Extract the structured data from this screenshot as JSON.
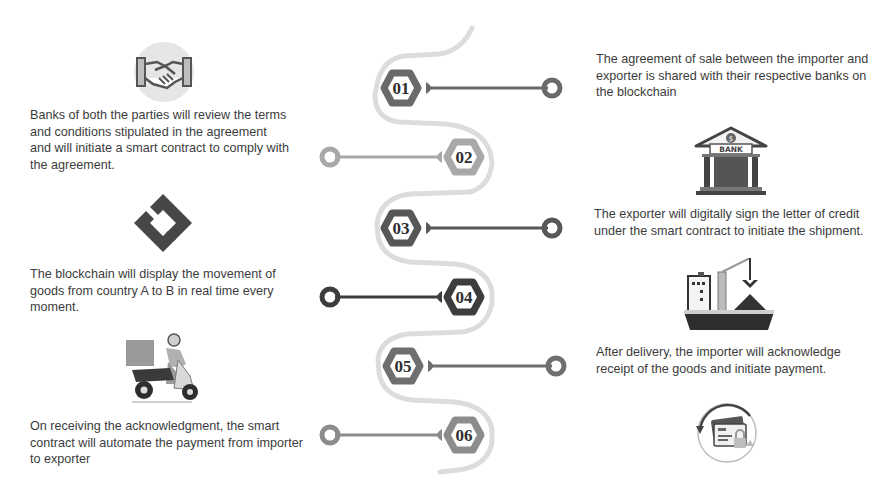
{
  "steps": [
    {
      "number": "01",
      "side": "right",
      "text": "The agreement of sale between the importer and exporter is shared with their respective banks on the blockchain",
      "tone": "#6a6a6a"
    },
    {
      "number": "02",
      "side": "left",
      "text": "Banks of both the parties will review the terms and conditions stipulated in the agreement and will initiate a smart contract to comply with the agreement.",
      "tone": "#a8a8a8"
    },
    {
      "number": "03",
      "side": "right",
      "text": "The exporter will digitally sign the letter of credit under the smart contract to initiate the shipment.",
      "tone": "#575757"
    },
    {
      "number": "04",
      "side": "left",
      "text": "The blockchain will display the movement of goods from country A to B in real time every moment.",
      "tone": "#3d3d3d"
    },
    {
      "number": "05",
      "side": "right",
      "text": "After delivery, the importer will acknowledge receipt of the goods and initiate payment.",
      "tone": "#6f6f6f"
    },
    {
      "number": "06",
      "side": "left",
      "text": "On receiving the acknowledgment, the smart contract will automate the payment from importer to exporter",
      "tone": "#8c8c8c"
    }
  ],
  "icons": {
    "handshake": "handshake-icon",
    "bank": "bank-icon",
    "bank_label": "BANK",
    "bank_symbol": "$",
    "blockchain": "blockchain-logo-icon",
    "ship": "cargo-ship-icon",
    "scooter": "delivery-scooter-icon",
    "payment": "secure-card-payment-icon"
  },
  "colors": {
    "wave": "#d6d6d6",
    "text": "#3c3c3c"
  }
}
